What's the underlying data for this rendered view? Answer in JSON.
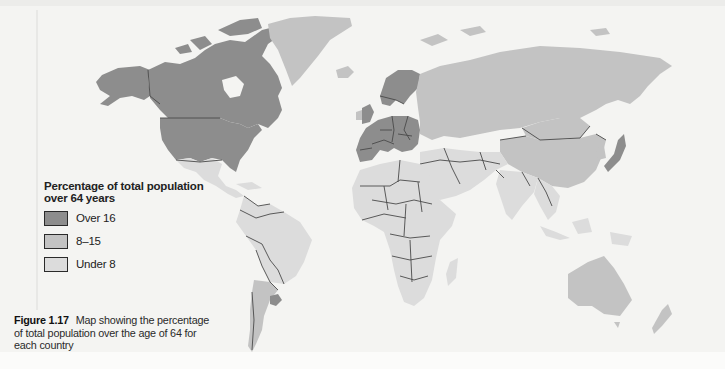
{
  "map": {
    "type": "choropleth",
    "subject": "World map of percentage of total population over 64 years by country",
    "legend": {
      "title": "Percentage of total population over 64 years",
      "items": [
        {
          "label": "Over 16",
          "class": "high",
          "color": "#8d8d8d"
        },
        {
          "label": "8–15",
          "class": "mid",
          "color": "#c3c3c3"
        },
        {
          "label": "Under 8",
          "class": "low",
          "color": "#dcdcdc"
        }
      ]
    },
    "regions": {
      "high": [
        "Canada",
        "United States",
        "Alaska",
        "Western Europe",
        "Scandinavia",
        "Uruguay",
        "Japan"
      ],
      "mid": [
        "Greenland",
        "Iceland",
        "Russia / USSR",
        "Eastern Europe",
        "China",
        "Argentina",
        "Chile",
        "Australia",
        "New Zealand",
        "Mongolia"
      ],
      "low": [
        "Mexico",
        "Central America",
        "South America (northern)",
        "Africa",
        "Middle East",
        "South Asia",
        "Southeast Asia",
        "Indonesia"
      ]
    }
  },
  "caption": {
    "figure_number": "Figure 1.17",
    "text": "Map showing the percentage of total population over the age of 64 for each country"
  }
}
